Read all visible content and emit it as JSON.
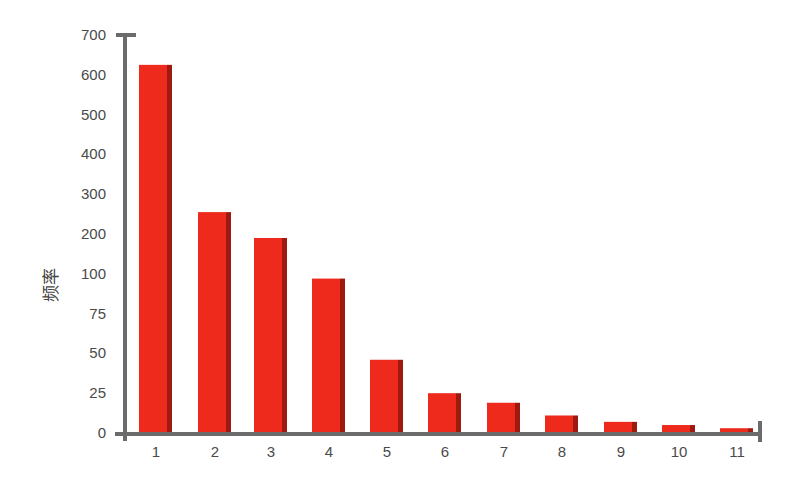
{
  "chart_data": {
    "type": "bar",
    "title": "",
    "xlabel": "",
    "ylabel": "频率",
    "categories": [
      "1",
      "2",
      "3",
      "4",
      "5",
      "6",
      "7",
      "8",
      "9",
      "10",
      "11"
    ],
    "values": [
      625,
      255,
      190,
      97,
      46,
      25,
      19,
      11,
      7,
      5,
      3
    ],
    "y_ticks": [
      0,
      25,
      50,
      75,
      100,
      200,
      300,
      400,
      500,
      600,
      700
    ],
    "y_axis_note": "non-linear segmented axis: 0-100 in steps of 25, 100-700 in steps of 100, equal spacing per tick",
    "ylim": [
      0,
      700
    ],
    "grid": false,
    "legend": null,
    "bar_color": "#ee2a1c",
    "bar_side_color": "#9e1a10",
    "axis_color": "#6b6b6b"
  }
}
